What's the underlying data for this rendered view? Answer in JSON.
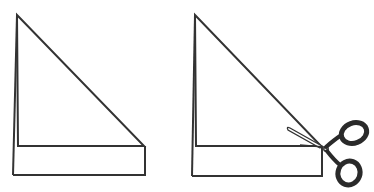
{
  "diagram": {
    "title": "",
    "panels": [
      {
        "id": "panel-1",
        "description": "Folded paper: right triangle on top of a rectangular strip",
        "has_scissors": false
      },
      {
        "id": "panel-2",
        "description": "Same folded paper with scissors cutting off the rectangular strip at the triangle corner",
        "has_scissors": true
      }
    ],
    "colors": {
      "stroke": "#333333",
      "background": "#ffffff",
      "scissors": "#2a2a2a"
    },
    "icons": [
      "scissors-icon"
    ]
  }
}
